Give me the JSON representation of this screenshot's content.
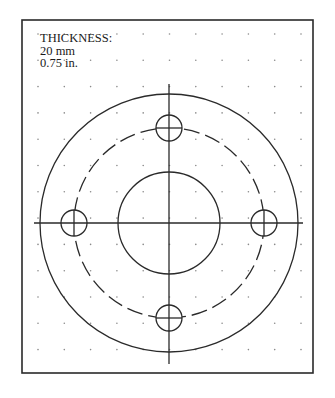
{
  "label": {
    "title": "THICKNESS:",
    "metric": "20 mm",
    "imperial": "0.75 in."
  },
  "drawing": {
    "frame": {
      "x": 22,
      "y": 20,
      "width": 291,
      "height": 353
    },
    "center": {
      "x": 169,
      "y": 223
    },
    "outer_radius": 129,
    "bolt_circle_radius": 95,
    "inner_radius": 51,
    "hole_radius": 13,
    "hole_count": 4,
    "grid_spacing": 26.3,
    "line_color": "#2a2a2a",
    "dot_color": "#8a8a8a"
  }
}
